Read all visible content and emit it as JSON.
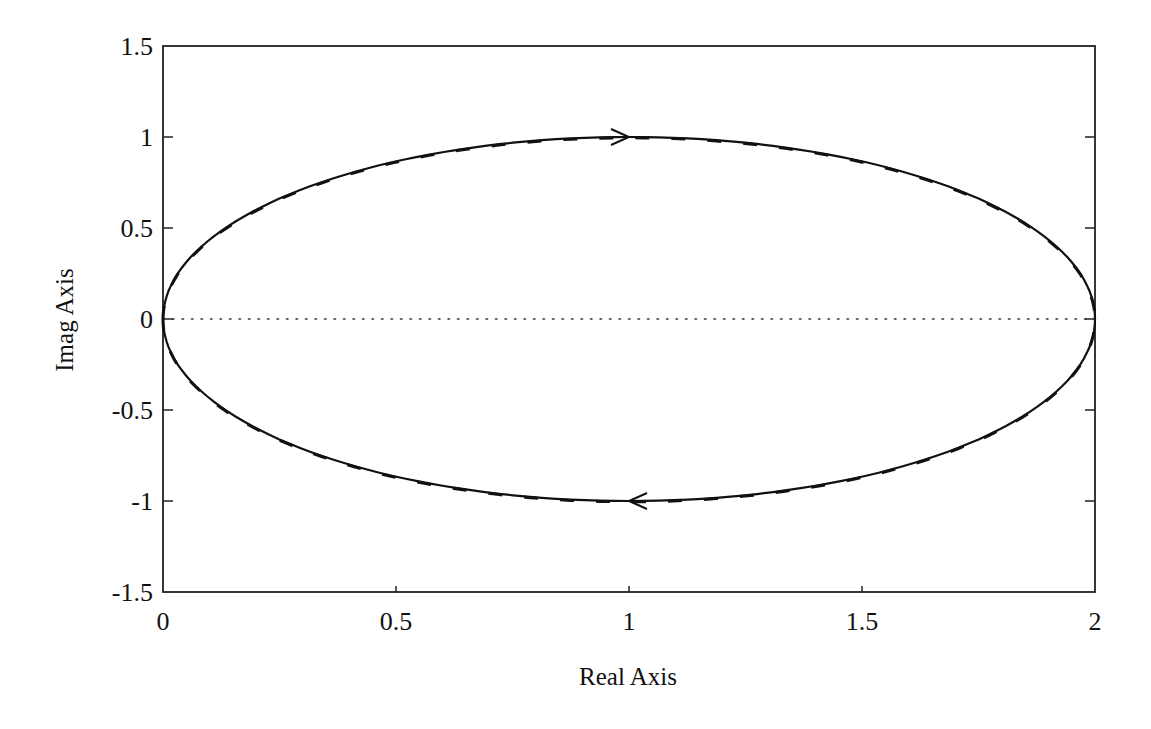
{
  "chart_data": {
    "type": "line",
    "title": "",
    "xlabel": "Real Axis",
    "ylabel": "Imag Axis",
    "xlim": [
      0,
      2
    ],
    "ylim": [
      -1.5,
      1.5
    ],
    "xticks": [
      0,
      0.5,
      1,
      1.5,
      2
    ],
    "xtick_labels": [
      "0",
      "0.5",
      "1",
      "1.5",
      "2"
    ],
    "yticks": [
      -1.5,
      -1,
      -0.5,
      0,
      0.5,
      1,
      1.5
    ],
    "ytick_labels": [
      "-1.5",
      "-1",
      "-0.5",
      "0",
      "0.5",
      "1",
      "1.5"
    ],
    "grid": false,
    "legend": null,
    "zero_line": {
      "y": 0,
      "style": "dotted"
    },
    "series": [
      {
        "name": "Nyquist contour (solid)",
        "style": "solid",
        "description": "Closed ellipse-like contour centered near (1, 0), passing through (0,0) and (2,0), reaching Imag ≈ +1 and ≈ -1 near Real ≈ 1.05",
        "points": [
          [
            0.0,
            0.0
          ],
          [
            0.05,
            0.31
          ],
          [
            0.15,
            0.55
          ],
          [
            0.3,
            0.74
          ],
          [
            0.5,
            0.88
          ],
          [
            0.75,
            0.97
          ],
          [
            1.0,
            1.0
          ],
          [
            1.25,
            0.97
          ],
          [
            1.5,
            0.87
          ],
          [
            1.7,
            0.71
          ],
          [
            1.85,
            0.5
          ],
          [
            1.95,
            0.28
          ],
          [
            2.0,
            0.0
          ],
          [
            1.95,
            -0.28
          ],
          [
            1.85,
            -0.5
          ],
          [
            1.7,
            -0.71
          ],
          [
            1.5,
            -0.87
          ],
          [
            1.25,
            -0.97
          ],
          [
            1.0,
            -1.0
          ],
          [
            0.75,
            -0.97
          ],
          [
            0.5,
            -0.88
          ],
          [
            0.3,
            -0.74
          ],
          [
            0.15,
            -0.55
          ],
          [
            0.05,
            -0.31
          ],
          [
            0.0,
            0.0
          ]
        ]
      },
      {
        "name": "Approximation (dashed)",
        "style": "dashed",
        "description": "Nearly coincident dashed contour overlaying the solid curve"
      }
    ],
    "annotations": [
      {
        "type": "arrow",
        "at": [
          1.0,
          1.0
        ],
        "direction": "right"
      },
      {
        "type": "arrow",
        "at": [
          1.0,
          -1.0
        ],
        "direction": "left"
      }
    ]
  }
}
